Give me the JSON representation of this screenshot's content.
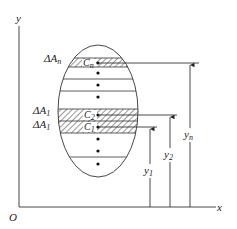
{
  "axes": {
    "y_label": "y",
    "x_label": "x",
    "origin_label": "O"
  },
  "strips": {
    "top_area_label": "ΔA",
    "top_area_sub": "n",
    "mid_area_label": "ΔA",
    "mid_area_sub": "1",
    "low_area_label": "ΔA",
    "low_area_sub": "1",
    "top_centroid": "C",
    "top_centroid_sub": "n",
    "mid_centroid": "C",
    "mid_centroid_sub": "2",
    "low_centroid": "C",
    "low_centroid_sub": "1"
  },
  "distances": {
    "y1": "y",
    "y1_sub": "1",
    "y2": "y",
    "y2_sub": "2",
    "yn": "y",
    "yn_sub": "n"
  }
}
